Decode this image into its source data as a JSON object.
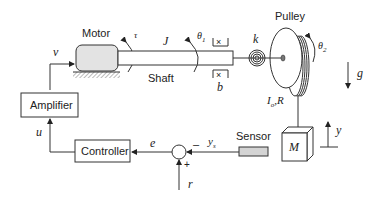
{
  "diagram": {
    "type": "block-diagram",
    "title": "",
    "blocks": {
      "motor": {
        "label": "Motor"
      },
      "shaft": {
        "label": "Shaft"
      },
      "pulley": {
        "label": "Pulley"
      },
      "amplifier": {
        "label": "Amplifier"
      },
      "controller": {
        "label": "Controller"
      },
      "sensor": {
        "label": "Sensor"
      },
      "mass": {
        "label": "M"
      }
    },
    "symbols": {
      "voltage": "v",
      "torque": "τ",
      "inertia": "J",
      "theta1": "θ",
      "theta1_sub": "1",
      "spring": "k",
      "damping": "b",
      "theta2": "θ",
      "theta2_sub": "2",
      "pulley_params": "I",
      "pulley_params_sub": "o",
      "pulley_params_tail": ",R",
      "gravity": "g",
      "position": "y",
      "sensor_out": "y",
      "sensor_out_sub": "s",
      "error": "e",
      "control": "u",
      "reference": "r",
      "minus": "–",
      "plus": "+",
      "bearing_mark": "×"
    },
    "colors": {
      "line": "#333333",
      "motor_fill": "#e3e3e3",
      "sensor_fill": "#d4d4d4",
      "pulley_hub": "#777777"
    }
  }
}
